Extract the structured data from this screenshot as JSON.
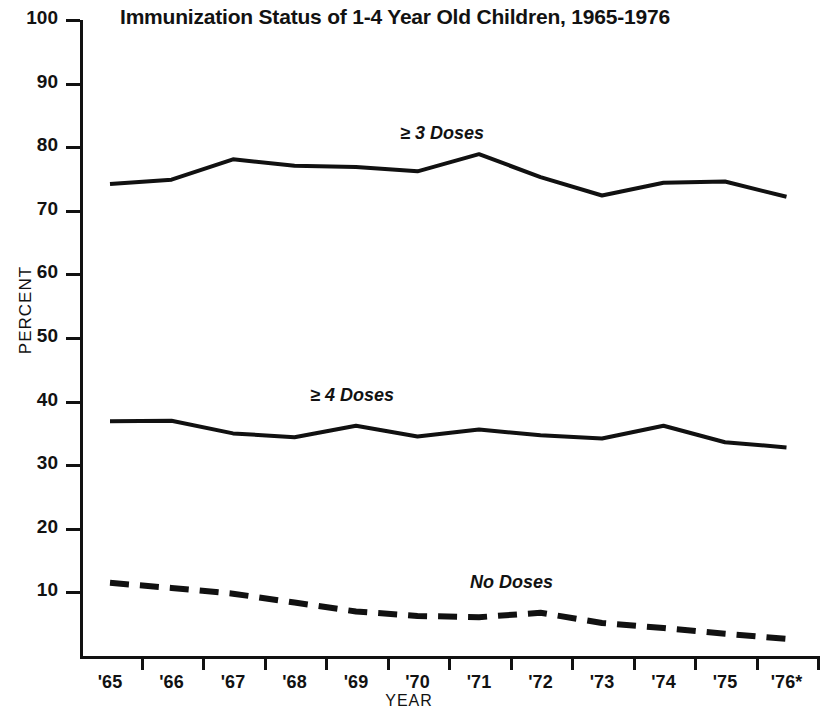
{
  "chart_data": {
    "type": "line",
    "title": "Immunization Status of 1-4 Year Old Children, 1965-1976",
    "xlabel": "YEAR",
    "ylabel": "PERCENT",
    "categories": [
      "'65",
      "'66",
      "'67",
      "'68",
      "'69",
      "'70",
      "'71",
      "'72",
      "'73",
      "'74",
      "'75",
      "'76*"
    ],
    "x_tick_labels": [
      "'65",
      "'66",
      "'67",
      "'68",
      "'69",
      "'70",
      "'71",
      "'72",
      "'73",
      "'74",
      "'75",
      "'76*"
    ],
    "y_tick_labels": [
      "10",
      "20",
      "30",
      "40",
      "50",
      "60",
      "70",
      "80",
      "90",
      "100"
    ],
    "y_ticks": [
      10,
      20,
      30,
      40,
      50,
      60,
      70,
      80,
      90,
      100
    ],
    "ylim": [
      0,
      100
    ],
    "grid": false,
    "legend_position": "inline-annotation",
    "series": [
      {
        "name": "≥ 3 Doses",
        "label": "≥ 3 Doses",
        "style": "solid",
        "values": [
          74.2,
          74.9,
          78.1,
          77.1,
          76.9,
          76.2,
          78.9,
          75.3,
          72.4,
          74.4,
          74.6,
          72.2
        ]
      },
      {
        "name": "≥ 4 Doses",
        "label": "≥ 4 Doses",
        "style": "solid",
        "values": [
          36.9,
          37.0,
          35.0,
          34.4,
          36.2,
          34.5,
          35.6,
          34.7,
          34.2,
          36.2,
          33.6,
          32.8
        ]
      },
      {
        "name": "No Doses",
        "label": "No Doses",
        "style": "dashed",
        "values": [
          11.5,
          10.7,
          9.8,
          8.4,
          7.0,
          6.3,
          6.1,
          6.8,
          5.2,
          4.4,
          3.5,
          2.7
        ]
      }
    ]
  },
  "annotations": {
    "three_doses": "≥ 3 Doses",
    "four_doses": "≥ 4 Doses",
    "no_doses": "No Doses"
  }
}
